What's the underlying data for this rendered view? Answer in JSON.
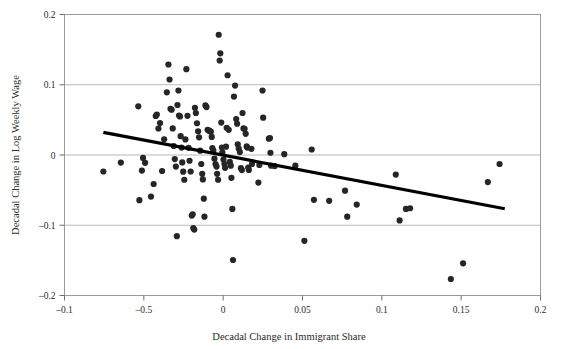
{
  "chart_data": {
    "type": "scatter",
    "title": "",
    "xlabel": "Decadal Change in Immigrant Share",
    "ylabel": "Decadal Change in Log Weekly Wage",
    "xlim": [
      -0.1,
      0.2
    ],
    "ylim": [
      -0.2,
      0.2
    ],
    "grid": "horizontal",
    "legend": "none",
    "x_tick_values": [
      -0.1,
      -0.05,
      0,
      0.05,
      0.1,
      0.15,
      0.2
    ],
    "x_tick_labels": [
      "-0.1",
      "-0.5",
      "0",
      "0.05",
      "0.1",
      "0.15",
      "0.2"
    ],
    "y_tick_values": [
      0.2,
      0.1,
      0,
      -0.1,
      -0.2
    ],
    "y_tick_labels": [
      "0.2",
      "0.1",
      "0",
      "-0.1",
      "-0.2"
    ],
    "gridline_values": [
      0.1,
      0,
      -0.1
    ],
    "marker": {
      "shape": "circle",
      "radius_px": 3.1,
      "color": "#262626"
    },
    "trendline": {
      "type": "linear-fit",
      "color": "#000000",
      "width_px": 3.2,
      "x_start": -0.0755,
      "y_start": 0.0322,
      "x_end": 0.1775,
      "y_end": -0.0765
    },
    "series": [
      {
        "name": "Local labor markets",
        "color": "#262626",
        "points": [
          [
            -0.0755,
            -0.0235
          ],
          [
            -0.0645,
            -0.0108
          ],
          [
            -0.0535,
            0.0693
          ],
          [
            -0.0528,
            -0.0643
          ],
          [
            -0.0512,
            -0.0222
          ],
          [
            -0.0505,
            -0.0042
          ],
          [
            -0.0492,
            -0.0112
          ],
          [
            -0.0455,
            -0.0592
          ],
          [
            -0.0438,
            -0.0413
          ],
          [
            -0.0425,
            0.0555
          ],
          [
            -0.0418,
            0.0575
          ],
          [
            -0.0408,
            0.0377
          ],
          [
            -0.0398,
            0.0455
          ],
          [
            -0.0385,
            -0.0228
          ],
          [
            -0.0372,
            0.0223
          ],
          [
            -0.0355,
            0.0892
          ],
          [
            -0.0345,
            0.1288
          ],
          [
            -0.0338,
            0.1075
          ],
          [
            -0.0332,
            0.0658
          ],
          [
            -0.0325,
            0.0645
          ],
          [
            -0.0318,
            0.0378
          ],
          [
            -0.0312,
            0.0128
          ],
          [
            -0.0305,
            -0.0058
          ],
          [
            -0.0298,
            -0.0165
          ],
          [
            -0.0292,
            -0.1155
          ],
          [
            -0.0288,
            0.0712
          ],
          [
            -0.0282,
            0.0918
          ],
          [
            -0.0278,
            0.0562
          ],
          [
            -0.0272,
            0.0548
          ],
          [
            -0.0268,
            0.0268
          ],
          [
            -0.0262,
            0.0105
          ],
          [
            -0.0258,
            -0.0105
          ],
          [
            -0.0252,
            -0.0238
          ],
          [
            -0.0245,
            -0.0352
          ],
          [
            -0.0238,
            0.0222
          ],
          [
            -0.0232,
            0.1222
          ],
          [
            -0.0225,
            0.0558
          ],
          [
            -0.0218,
            0.0102
          ],
          [
            -0.0212,
            -0.0082
          ],
          [
            -0.0205,
            -0.0235
          ],
          [
            -0.0198,
            -0.0862
          ],
          [
            -0.0192,
            -0.0845
          ],
          [
            -0.0188,
            -0.1042
          ],
          [
            -0.0182,
            -0.1062
          ],
          [
            -0.0178,
            0.0672
          ],
          [
            -0.0172,
            0.0598
          ],
          [
            -0.0165,
            0.0452
          ],
          [
            -0.0158,
            0.0338
          ],
          [
            -0.0152,
            0.0252
          ],
          [
            -0.0145,
            0.0062
          ],
          [
            -0.0138,
            -0.0128
          ],
          [
            -0.0132,
            -0.0268
          ],
          [
            -0.0128,
            -0.0348
          ],
          [
            -0.0122,
            -0.0622
          ],
          [
            -0.0118,
            -0.0878
          ],
          [
            -0.0112,
            0.0705
          ],
          [
            -0.0105,
            0.0682
          ],
          [
            -0.0098,
            0.0358
          ],
          [
            -0.0092,
            0.0352
          ],
          [
            -0.0088,
            0.0345
          ],
          [
            -0.0082,
            0.0338
          ],
          [
            -0.0078,
            0.0332
          ],
          [
            -0.0072,
            0.0258
          ],
          [
            -0.0068,
            0.0098
          ],
          [
            -0.0062,
            0.0062
          ],
          [
            -0.0055,
            -0.0052
          ],
          [
            -0.0048,
            -0.0128
          ],
          [
            -0.0042,
            -0.0165
          ],
          [
            -0.0038,
            -0.0268
          ],
          [
            -0.0032,
            -0.0352
          ],
          [
            -0.0028,
            0.1712
          ],
          [
            -0.0022,
            0.1345
          ],
          [
            -0.0018,
            0.1448
          ],
          [
            -0.0012,
            0.0462
          ],
          [
            -0.0008,
            0.0105
          ],
          [
            -0.0005,
            0.0038
          ],
          [
            0.0002,
            -0.0065
          ],
          [
            0.0008,
            -0.0128
          ],
          [
            0.0012,
            -0.0182
          ],
          [
            0.0018,
            0.0118
          ],
          [
            0.0022,
            0.0388
          ],
          [
            0.0028,
            0.1135
          ],
          [
            0.0035,
            0.0358
          ],
          [
            0.0042,
            -0.0098
          ],
          [
            0.0048,
            -0.0152
          ],
          [
            0.0052,
            -0.0325
          ],
          [
            0.0058,
            -0.0768
          ],
          [
            0.0062,
            -0.1495
          ],
          [
            0.0068,
            0.0832
          ],
          [
            0.0075,
            0.0988
          ],
          [
            0.0082,
            0.0512
          ],
          [
            0.0088,
            0.0445
          ],
          [
            0.0092,
            0.0152
          ],
          [
            0.0098,
            0.0092
          ],
          [
            0.0105,
            0.0042
          ],
          [
            0.0112,
            -0.0188
          ],
          [
            0.0118,
            -0.0215
          ],
          [
            0.0122,
            0.0598
          ],
          [
            0.0128,
            0.0378
          ],
          [
            0.0135,
            0.0372
          ],
          [
            0.0142,
            0.0302
          ],
          [
            0.0148,
            0.0122
          ],
          [
            0.0152,
            0.0105
          ],
          [
            0.0158,
            -0.0178
          ],
          [
            0.0162,
            -0.0212
          ],
          [
            0.0178,
            0.0088
          ],
          [
            0.0182,
            -0.0128
          ],
          [
            0.0222,
            -0.0392
          ],
          [
            0.0228,
            -0.0142
          ],
          [
            0.0248,
            0.0918
          ],
          [
            0.0252,
            0.0532
          ],
          [
            0.0288,
            0.0232
          ],
          [
            0.0295,
            0.0242
          ],
          [
            0.0298,
            0.0032
          ],
          [
            0.0302,
            -0.0152
          ],
          [
            0.0325,
            -0.0158
          ],
          [
            0.0385,
            0.0012
          ],
          [
            0.0455,
            -0.0152
          ],
          [
            0.0512,
            -0.1222
          ],
          [
            0.0558,
            0.0078
          ],
          [
            0.0572,
            -0.0638
          ],
          [
            0.0668,
            -0.0652
          ],
          [
            0.0768,
            -0.0508
          ],
          [
            0.0782,
            -0.0878
          ],
          [
            0.0842,
            -0.0705
          ],
          [
            0.1088,
            -0.0278
          ],
          [
            0.1112,
            -0.0932
          ],
          [
            0.1152,
            -0.0768
          ],
          [
            0.1178,
            -0.0758
          ],
          [
            0.1435,
            -0.1765
          ],
          [
            0.1512,
            -0.1542
          ],
          [
            0.1668,
            -0.0385
          ],
          [
            0.1742,
            -0.0128
          ]
        ]
      }
    ]
  }
}
